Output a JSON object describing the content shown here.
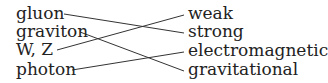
{
  "left": [
    "gluon",
    "graviton",
    "W, Z",
    "photon"
  ],
  "right": [
    "weak",
    "strong",
    "electromagnetic",
    "gravitational"
  ],
  "connections": [
    {
      "from": "gluon",
      "to": "strong"
    },
    {
      "from": "graviton",
      "to": "gravitational"
    },
    {
      "from": "W, Z",
      "to": "weak"
    },
    {
      "from": "photon",
      "to": "electromagnetic"
    }
  ]
}
